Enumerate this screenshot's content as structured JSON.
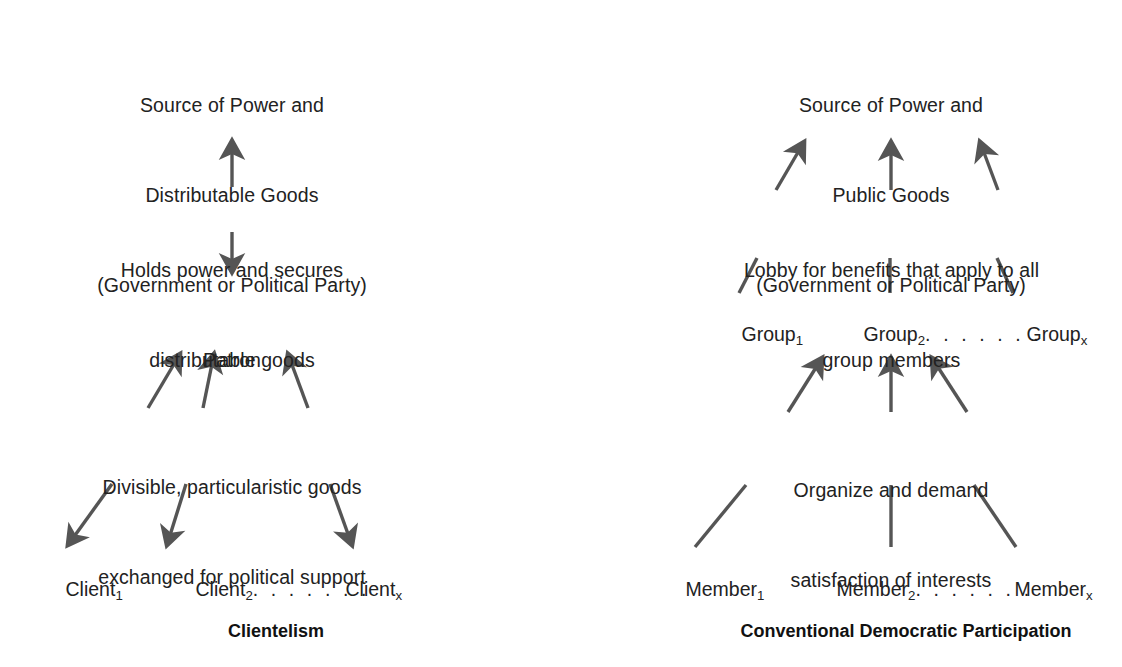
{
  "figure": {
    "type": "diagram",
    "ink_color": "#555555",
    "text_color": "#222222",
    "background": "#ffffff"
  },
  "left": {
    "caption": "Clientelism",
    "top_box": {
      "line1": "Source of Power and",
      "line2": "Distributable Goods",
      "line3": "(Government or Political Party)"
    },
    "mid_label": {
      "line1": "Holds power and secures",
      "line2": "distributable goods"
    },
    "center_node": "Patron",
    "lower_label": {
      "line1": "Divisible, particularistic goods",
      "line2": "exchanged for political support"
    },
    "bottom_nodes": {
      "first_base": "Client",
      "first_sub": "1",
      "second_base": "Client",
      "second_sub": "2",
      "ellipsis": ". . . . . . .",
      "last_base": "Client",
      "last_sub": "x"
    }
  },
  "right": {
    "caption": "Conventional Democratic Participation",
    "top_box": {
      "line1": "Source of Power and",
      "line2": "Public Goods",
      "line3": "(Government or Political Party)"
    },
    "mid_label": {
      "line1": "Lobby for benefits that apply to all",
      "line2": "group members"
    },
    "mid_nodes": {
      "first_base": "Group",
      "first_sub": "1",
      "second_base": "Group",
      "second_sub": "2",
      "ellipsis": ". . . . . . .",
      "last_base": "Group",
      "last_sub": "x"
    },
    "lower_label": {
      "line1": "Organize and demand",
      "line2": "satisfaction of interests"
    },
    "bottom_nodes": {
      "first_base": "Member",
      "first_sub": "1",
      "second_base": "Member",
      "second_sub": "2",
      "ellipsis": ". . . . . . .",
      "last_base": "Member",
      "last_sub": "x"
    }
  }
}
